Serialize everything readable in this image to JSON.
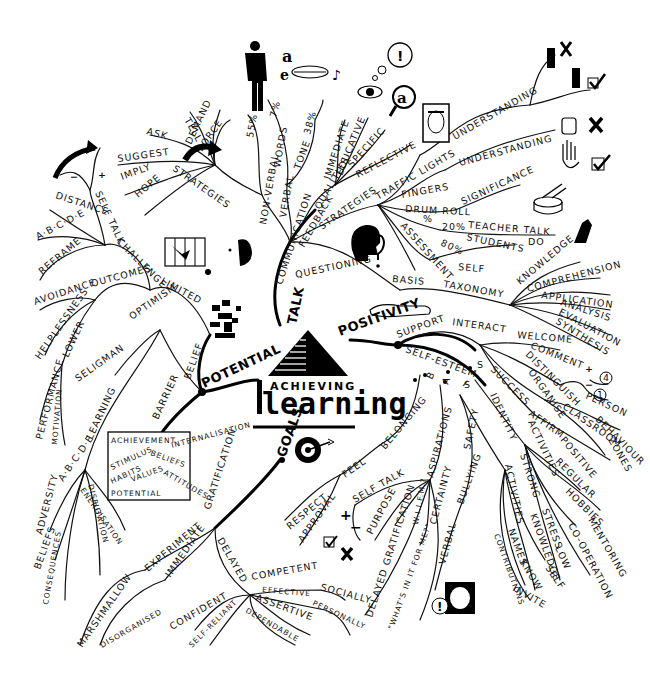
{
  "diagram": {
    "type": "mind-map",
    "center": {
      "line1": "ACHIEVING",
      "line2": "learning",
      "icon": "pyramid-icon"
    },
    "main_branches": {
      "talk": "TALK",
      "positivity": "POSITIVITY",
      "goals": "GOALS",
      "potential": "POTENTIAL"
    },
    "talk": {
      "communication": "COMMUNICATION",
      "non_verbal": "NON-VERBAL",
      "pct_55": "55%",
      "verbal": "VERBAL",
      "words": "WORDS",
      "pct_7": "7%",
      "tone": "TONE",
      "pct_38": "38%",
      "strategies": "STRATEGIES",
      "strategy_items": [
        "TELL",
        "DEMAND",
        "FORCE",
        "ASK",
        "SUGGEST",
        "IMPLY",
        "HOPE"
      ],
      "feedback": "FEEDBACK",
      "qualities": "QUALITIES",
      "quality_items": [
        "IMMEDIATE",
        "EDUCATIVE",
        "SPECIFIC",
        "REFLECTIVE"
      ],
      "fb_strategies": "STRATEGIES",
      "traffic_lights": "TRAFFIC LIGHTS",
      "understanding_1": "UNDERSTANDING",
      "fingers": "FINGERS",
      "understanding_2": "UNDERSTANDING",
      "drum_roll": "DRUM ROLL",
      "significance": "SIGNIFICANCE",
      "percent": "%",
      "pct_20": "20%",
      "teacher_talk": "TEACHER TALK",
      "pct_80": "80%",
      "students": "STUDENTS",
      "do": "DO",
      "assessment": "ASSESSMENT",
      "self": "SELF",
      "questioning": "QUESTIONING",
      "basis": "BASIS",
      "taxonomy": "TAXONOMY",
      "taxonomy_items": [
        "KNOWLEDGE",
        "COMPREHENSION",
        "APPLICATION",
        "ANALYSIS",
        "EVALUATION",
        "SYNTHESIS"
      ]
    },
    "positivity": {
      "support": "SUPPORT",
      "interact": "INTERACT",
      "welcome": "WELCOME",
      "comment": "COMMENT",
      "plus": "+",
      "minus": "−",
      "four": "4",
      "one": "1",
      "distinguish": "DISTINGUISH",
      "person": "PERSON",
      "behaviour": "BEHAVIOUR",
      "organise": "ORGANISE",
      "classroom": "CLASSROOM",
      "zones": "ZONES",
      "self_esteem": "SELF-ESTEEM",
      "s_success": "S",
      "success": "SUCCESS",
      "affirm": "AFFIRM",
      "positive": "POSITIVE",
      "activities_1": "ACTIVITIES",
      "regular": "REGULAR",
      "hobbies": "HOBBIES",
      "mentoring": "MENTORING",
      "cooperation": "CO-OPERATION",
      "i_letter": "I",
      "identity": "IDENTITY",
      "strong": "STRONG",
      "stress": "STRESS",
      "low": "LOW",
      "knowledge": "KNOWLEDGE",
      "self": "SELF",
      "activities_2": "ACTIVITIES",
      "names": "NAMES",
      "know": "KNOW",
      "contributions": "CONTRIBUTIONS",
      "invite": "INVITE",
      "s_safety": "S",
      "safety": "SAFETY",
      "bullying": "BULLYING",
      "verbal": "VERBAL",
      "a_letter": "A",
      "aspirations": "ASPIRATIONS",
      "certainty": "CERTAINTY",
      "wiifm": "W.I.I.F.M.?",
      "whats_in_it": "\"WHAT'S IN IT FOR ME?\"",
      "b_letter": "B",
      "belonging": "BELONGING",
      "feel": "FEEL",
      "respect": "RESPECT",
      "approval": "APPROVAL",
      "self_talk": "SELF TALK",
      "purpose": "PURPOSE",
      "delayed_gratification": "DELAYED GRATIFICATION"
    },
    "goals": {
      "gratification": "GRATIFICATION",
      "experiment": "EXPERIMENT",
      "marshmallow": "MARSHMALLOW",
      "immediate": "IMMEDIATE",
      "disorganised": "DISORGANISED",
      "delayed": "DELAYED",
      "competent": "COMPETENT",
      "socially": "SOCIALLY",
      "effective": "EFFECTIVE",
      "personally": "PERSONALLY",
      "assertive": "ASSERTIVE",
      "dependable": "DEPENDABLE",
      "confident": "CONFIDENT",
      "self_reliant": "SELF-RELIANT"
    },
    "potential": {
      "belief": "BELIEF",
      "barrier": "BARRIER",
      "limited": "LIMITED",
      "challenge": "CHALLENGE",
      "self_talk": "SELF TALK",
      "plus": "+",
      "minus": "−",
      "distance": "DISTANCE",
      "abcde_1": "A·B·C·D·E",
      "reframe": "REFRAME",
      "outcomes": "OUTCOMES",
      "avoidance": "AVOIDANCE",
      "helplessness": "HELPLESSNESS",
      "lower": "LOWER",
      "performance": "PERFORMANCE",
      "motivation": "MOTIVATION",
      "optimism": "OPTIMISM",
      "seligman": "SELIGMAN",
      "learning": "LEARNING",
      "abcde_2": "A·B·C·D·E",
      "adversity": "ADVERSITY",
      "beliefs": "BELIEFS",
      "consequences": "CONSEQUENCES",
      "disputation": "DISPUTATION",
      "energisation": "ENERGISATION",
      "box": {
        "achievement": "ACHIEVEMENT",
        "stimulus": "STIMULUS",
        "beliefs": "BELIEFS",
        "habits": "HABITS",
        "values": "VALUES",
        "attitudes": "ATTITUDES",
        "potential": "POTENTIAL"
      },
      "internalisation": "INTERNALISATION"
    }
  }
}
